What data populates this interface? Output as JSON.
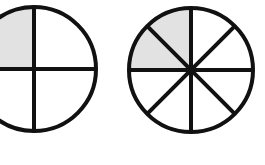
{
  "diagram": {
    "colors": {
      "stroke": "#111111",
      "shade": "#e2e2e2",
      "background": "#ffffff"
    },
    "circles": [
      {
        "id": "quarters",
        "parts": 4,
        "shaded_parts": 1,
        "fraction": "1/4",
        "shaded_region": "top-left"
      },
      {
        "id": "eighths",
        "parts": 8,
        "shaded_parts": 2,
        "fraction": "2/8",
        "shaded_region": "top-left"
      }
    ]
  }
}
